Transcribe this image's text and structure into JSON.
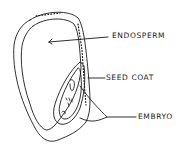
{
  "diagram": {
    "type": "labeled-sketch",
    "labels": {
      "endosperm": "ENDOSPERM",
      "seed_coat": "SEED COAT",
      "embryo": "EMBRYO"
    },
    "colors": {
      "ink": "#1a1a1a",
      "background": "#ffffff"
    }
  }
}
